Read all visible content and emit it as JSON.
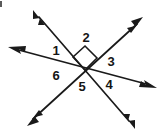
{
  "figure": {
    "title": "Six angles formed by three intersecting lines",
    "background_color": "#ffffff",
    "line_color": "#1a1a1a",
    "label_color": "#151515",
    "width": 163,
    "height": 134,
    "intersection": {
      "x": 85,
      "y": 70
    },
    "labels": [
      {
        "id": "angle-1",
        "text": "1",
        "x": 56,
        "y": 52
      },
      {
        "id": "angle-2",
        "text": "2",
        "x": 86,
        "y": 39
      },
      {
        "id": "angle-3",
        "text": "3",
        "x": 111,
        "y": 63
      },
      {
        "id": "angle-4",
        "text": "4",
        "x": 109,
        "y": 86
      },
      {
        "id": "angle-5",
        "text": "5",
        "x": 82,
        "y": 88
      },
      {
        "id": "angle-6",
        "text": "6",
        "x": 56,
        "y": 77
      }
    ],
    "lines": [
      {
        "id": "line-a",
        "description": "upper-left to lower-right line",
        "from": {
          "x": 35,
          "y": 13
        },
        "to": {
          "x": 133,
          "y": 126
        }
      },
      {
        "id": "line-b",
        "description": "left to right nearly horizontal line",
        "from": {
          "x": 10,
          "y": 48
        },
        "to": {
          "x": 155,
          "y": 87
        }
      },
      {
        "id": "line-c",
        "description": "lower-left to upper-right line",
        "from": {
          "x": 29,
          "y": 123
        },
        "to": {
          "x": 141,
          "y": 20
        }
      }
    ],
    "right_angle_marker": {
      "id": "right-angle-mark",
      "description": "square marker indicating a 90 degree angle between angle 1 and angle 2 rays",
      "points": "85,70 73,57 85,46 97,58"
    }
  }
}
